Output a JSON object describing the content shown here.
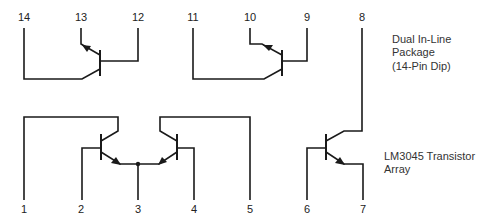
{
  "diagram": {
    "type": "schematic",
    "description_top": [
      "Dual In-Line",
      "Package",
      "(14-Pin Dip)"
    ],
    "description_bottom": [
      "LM3045 Transistor",
      "Array"
    ],
    "pins": {
      "p1": "1",
      "p2": "2",
      "p3": "3",
      "p4": "4",
      "p5": "5",
      "p6": "6",
      "p7": "7",
      "p8": "8",
      "p9": "9",
      "p10": "10",
      "p11": "11",
      "p12": "12",
      "p13": "13",
      "p14": "14"
    },
    "transistors": [
      {
        "name": "Q1",
        "collector": "14",
        "base": "12",
        "emitter": "13"
      },
      {
        "name": "Q2",
        "collector": "11",
        "base": "9",
        "emitter": "10"
      },
      {
        "name": "Q3",
        "collector": "1",
        "base": "2",
        "emitter": "3"
      },
      {
        "name": "Q4",
        "collector": "5",
        "base": "4",
        "emitter": "3"
      },
      {
        "name": "Q5",
        "collector": "8",
        "base": "6",
        "emitter": "7"
      }
    ]
  }
}
